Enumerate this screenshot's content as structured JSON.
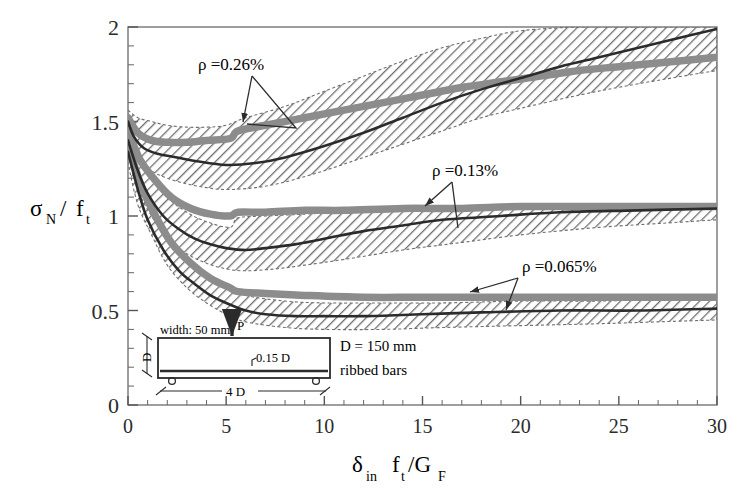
{
  "chart_data": {
    "type": "line",
    "title": "",
    "xlabel": "δin ft/GF",
    "ylabel": "σN / ft",
    "xlim": [
      0,
      30
    ],
    "ylim": [
      0,
      2
    ],
    "grid": false,
    "legend_position": "inline-annotations",
    "x_ticks": [
      0,
      5,
      10,
      15,
      20,
      25,
      30
    ],
    "x_tick_labels": [
      "0",
      "5",
      "10",
      "15",
      "20",
      "25",
      "30"
    ],
    "x_minor_step": 1,
    "y_ticks": [
      0,
      0.5,
      1,
      1.5,
      2
    ],
    "y_tick_labels": [
      "0",
      "0.5",
      "1",
      "1.5",
      "2"
    ],
    "y_minor_step": 0.1,
    "series": [
      {
        "name": "ρ =0.26%",
        "kind": "analysis-mean",
        "x": [
          0.0,
          0.3,
          0.8,
          1.5,
          2.5,
          3.5,
          5.0,
          6.5,
          8.0,
          10.0,
          12.0,
          14.0,
          16.0,
          18.0,
          20.0,
          22.0,
          24.0,
          26.0,
          28.0,
          30.0
        ],
        "values": [
          1.5,
          1.42,
          1.36,
          1.33,
          1.31,
          1.29,
          1.27,
          1.28,
          1.31,
          1.37,
          1.44,
          1.52,
          1.6,
          1.67,
          1.73,
          1.79,
          1.84,
          1.89,
          1.94,
          1.99
        ]
      },
      {
        "name": "ρ =0.26% experimental",
        "kind": "experiment-band",
        "x": [
          0.0,
          0.5,
          1.2,
          2.0,
          3.0,
          4.0,
          5.2,
          5.6,
          7.0,
          9.0,
          11.0,
          13.0,
          15.0,
          17.0,
          19.0,
          21.0,
          23.0,
          25.0,
          27.0,
          30.0
        ],
        "values": [
          1.52,
          1.44,
          1.4,
          1.39,
          1.39,
          1.4,
          1.41,
          1.45,
          1.48,
          1.52,
          1.56,
          1.6,
          1.64,
          1.68,
          1.71,
          1.74,
          1.77,
          1.79,
          1.81,
          1.84
        ]
      },
      {
        "name": "ρ =0.26% upper envelope",
        "kind": "band-upper",
        "x": [
          0.0,
          0.5,
          1.2,
          2.0,
          3.0,
          4.0,
          5.0,
          6.0,
          8.0,
          10.0,
          12.0,
          14.0,
          16.0,
          18.0,
          20.0,
          23.0,
          26.0,
          30.0
        ],
        "values": [
          1.56,
          1.52,
          1.5,
          1.48,
          1.47,
          1.47,
          1.48,
          1.52,
          1.58,
          1.66,
          1.74,
          1.82,
          1.89,
          1.94,
          1.98,
          2.0,
          2.0,
          2.0
        ]
      },
      {
        "name": "ρ =0.26% lower envelope",
        "kind": "band-lower",
        "x": [
          0.0,
          0.5,
          1.2,
          2.0,
          3.0,
          4.0,
          5.0,
          6.5,
          8.0,
          10.0,
          12.0,
          14.0,
          16.0,
          18.0,
          20.0,
          23.0,
          26.0,
          30.0
        ],
        "values": [
          1.44,
          1.32,
          1.24,
          1.2,
          1.17,
          1.15,
          1.14,
          1.15,
          1.18,
          1.24,
          1.31,
          1.38,
          1.45,
          1.52,
          1.57,
          1.64,
          1.7,
          1.77
        ]
      },
      {
        "name": "ρ =0.13%",
        "kind": "analysis-mean",
        "x": [
          0.0,
          0.5,
          1.0,
          1.8,
          2.6,
          3.4,
          4.2,
          5.0,
          6.0,
          7.0,
          8.5,
          10.0,
          12.0,
          14.0,
          16.0,
          19.0,
          22.0,
          26.0,
          30.0
        ],
        "values": [
          1.4,
          1.24,
          1.12,
          1.0,
          0.93,
          0.88,
          0.85,
          0.83,
          0.82,
          0.83,
          0.85,
          0.88,
          0.92,
          0.95,
          0.98,
          1.0,
          1.02,
          1.03,
          1.04
        ]
      },
      {
        "name": "ρ =0.13% experimental",
        "kind": "experiment-band",
        "x": [
          0.0,
          0.6,
          1.3,
          2.2,
          3.2,
          4.2,
          5.2,
          5.6,
          7.0,
          9.0,
          11.0,
          14.0,
          17.0,
          20.0,
          24.0,
          27.0,
          30.0
        ],
        "values": [
          1.45,
          1.3,
          1.2,
          1.1,
          1.04,
          1.01,
          1.0,
          1.02,
          1.02,
          1.03,
          1.03,
          1.04,
          1.04,
          1.05,
          1.05,
          1.05,
          1.05
        ]
      },
      {
        "name": "ρ =0.13% upper envelope",
        "kind": "band-upper",
        "x": [
          0.0,
          0.5,
          1.2,
          2.0,
          3.0,
          4.0,
          5.2,
          5.6,
          7.0,
          9.0,
          11.0,
          14.0,
          17.0,
          20.0,
          24.0,
          27.0,
          30.0
        ],
        "values": [
          1.48,
          1.34,
          1.22,
          1.1,
          1.02,
          0.97,
          0.94,
          0.99,
          1.0,
          1.01,
          1.02,
          1.03,
          1.04,
          1.04,
          1.05,
          1.05,
          1.05
        ]
      },
      {
        "name": "ρ =0.13% lower envelope",
        "kind": "band-lower",
        "x": [
          0.0,
          0.5,
          1.2,
          2.0,
          3.0,
          4.0,
          5.0,
          6.0,
          7.5,
          9.0,
          11.0,
          14.0,
          17.0,
          20.0,
          24.0,
          27.0,
          30.0
        ],
        "values": [
          1.34,
          1.14,
          1.0,
          0.88,
          0.8,
          0.75,
          0.72,
          0.71,
          0.72,
          0.74,
          0.77,
          0.82,
          0.86,
          0.9,
          0.94,
          0.96,
          0.98
        ]
      },
      {
        "name": "ρ =0.065%",
        "kind": "analysis-mean",
        "x": [
          0.0,
          0.5,
          1.0,
          1.8,
          2.6,
          3.4,
          4.2,
          5.0,
          6.0,
          7.0,
          8.5,
          10.0,
          12.0,
          15.0,
          18.0,
          22.0,
          26.0,
          30.0
        ],
        "values": [
          1.34,
          1.14,
          0.98,
          0.82,
          0.71,
          0.64,
          0.58,
          0.54,
          0.5,
          0.48,
          0.47,
          0.47,
          0.47,
          0.48,
          0.49,
          0.5,
          0.5,
          0.51
        ]
      },
      {
        "name": "ρ =0.065% experimental",
        "kind": "experiment-band",
        "x": [
          0.0,
          0.6,
          1.3,
          2.2,
          3.2,
          4.2,
          5.2,
          5.6,
          7.0,
          9.0,
          12.0,
          15.0,
          19.0,
          23.0,
          27.0,
          30.0
        ],
        "values": [
          1.38,
          1.18,
          1.02,
          0.86,
          0.75,
          0.67,
          0.62,
          0.6,
          0.59,
          0.58,
          0.57,
          0.57,
          0.57,
          0.57,
          0.57,
          0.57
        ]
      },
      {
        "name": "ρ =0.065% upper envelope",
        "kind": "band-upper",
        "x": [
          0.0,
          0.5,
          1.2,
          2.0,
          3.0,
          4.0,
          5.0,
          6.0,
          8.0,
          10.0,
          13.0,
          16.0,
          20.0,
          24.0,
          27.0,
          30.0
        ],
        "values": [
          1.4,
          1.2,
          1.04,
          0.9,
          0.78,
          0.7,
          0.63,
          0.58,
          0.55,
          0.54,
          0.54,
          0.54,
          0.55,
          0.55,
          0.56,
          0.56
        ]
      },
      {
        "name": "ρ =0.065% lower envelope",
        "kind": "band-lower",
        "x": [
          0.0,
          0.5,
          1.2,
          2.0,
          3.0,
          4.0,
          5.0,
          6.0,
          8.0,
          10.0,
          13.0,
          16.0,
          20.0,
          24.0,
          27.0,
          30.0
        ],
        "values": [
          1.28,
          1.06,
          0.9,
          0.74,
          0.62,
          0.54,
          0.48,
          0.44,
          0.41,
          0.4,
          0.4,
          0.41,
          0.42,
          0.43,
          0.44,
          0.45
        ]
      }
    ],
    "annotations": [
      {
        "id": "rho-026",
        "text": "ρ =0.26%",
        "x": 4.3,
        "y": 1.78
      },
      {
        "id": "rho-013",
        "text": "ρ =0.13%",
        "x": 16.8,
        "y": 1.12
      },
      {
        "id": "rho-0065",
        "text": "ρ =0.065%",
        "x": 19.8,
        "y": 0.72
      }
    ]
  },
  "axes": {
    "y_label_sigma": "σ",
    "y_label_sigma_sub": "N",
    "y_label_slash": "/",
    "y_label_f": "f",
    "y_label_f_sub": "t",
    "x_label_delta": "δ",
    "x_label_delta_sub": "in",
    "x_label_f": "f",
    "x_label_f_sub": "t",
    "x_label_rest": "/G",
    "x_label_rest_sub": "F"
  },
  "inset": {
    "width_note": "width: 50 mm",
    "cover_note": "0.15 D",
    "depth_note": "D",
    "span_note": "4 D",
    "load_note": "P",
    "depth_value": "D = 150 mm",
    "bar_type": "ribbed bars"
  },
  "colors": {
    "ink": "#2b2b2b",
    "axis": "#555555",
    "hatch": "#6e6e6e",
    "experiment": "#8c8c8c",
    "background": "#ffffff"
  }
}
